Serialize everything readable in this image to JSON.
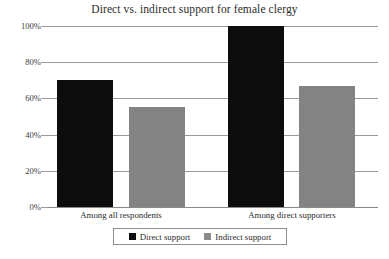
{
  "chart_data": {
    "type": "bar",
    "title": "Direct vs. indirect support for female clergy",
    "xlabel": "",
    "ylabel": "",
    "categories": [
      "Among all respondents",
      "Among direct supporters"
    ],
    "series": [
      {
        "name": "Direct support",
        "color": "#0d0d0d",
        "values": [
          70,
          100
        ]
      },
      {
        "name": "Indirect support",
        "color": "#838383",
        "values": [
          55,
          67
        ]
      }
    ],
    "ylim": [
      0,
      100
    ],
    "ytick_labels": [
      "0%",
      "20%",
      "40%",
      "60%",
      "80%",
      "100%"
    ],
    "ytick_values": [
      0,
      20,
      40,
      60,
      80,
      100
    ],
    "grid": true,
    "legend_position": "bottom"
  },
  "legend": {
    "items": [
      {
        "label": "Direct support",
        "swatch": "black-square-swatch"
      },
      {
        "label": "Indirect support",
        "swatch": "gray-square-swatch"
      }
    ]
  }
}
